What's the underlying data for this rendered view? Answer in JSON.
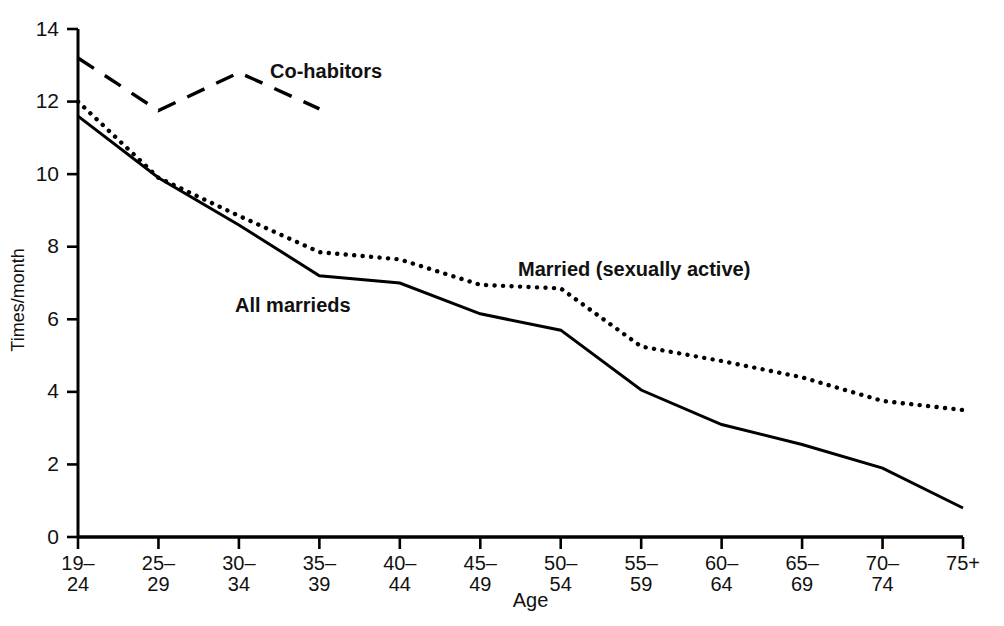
{
  "chart_data": {
    "type": "line",
    "title": "",
    "xlabel": "Age",
    "ylabel": "Times/month",
    "ylim": [
      0,
      14
    ],
    "yticks": [
      0,
      2,
      4,
      6,
      8,
      10,
      12,
      14
    ],
    "ytick_labels": [
      "0",
      "2",
      "4",
      "6",
      "8",
      "10",
      "12",
      "14"
    ],
    "grid": false,
    "legend": "inline-annotations",
    "categories": [
      "19–24",
      "25–29",
      "30–34",
      "35–39",
      "40–44",
      "45–49",
      "50–54",
      "55–59",
      "60–64",
      "65–69",
      "70–74",
      "75+"
    ],
    "xtick_labels_top": [
      "19–",
      "25–",
      "30–",
      "35–",
      "40–",
      "45–",
      "50–",
      "55–",
      "60–",
      "65–",
      "70–",
      "75+"
    ],
    "xtick_labels_bottom": [
      "24",
      "29",
      "34",
      "39",
      "44",
      "49",
      "54",
      "59",
      "64",
      "69",
      "74",
      ""
    ],
    "series": [
      {
        "name": "All marrieds",
        "style": "solid",
        "color": "#000000",
        "values": [
          11.6,
          9.9,
          8.6,
          7.2,
          7.0,
          6.15,
          5.7,
          4.05,
          3.1,
          2.55,
          1.9,
          0.8
        ]
      },
      {
        "name": "Married (sexually active)",
        "style": "dotted",
        "color": "#000000",
        "values": [
          12.0,
          9.9,
          8.85,
          7.85,
          7.65,
          6.95,
          6.85,
          5.25,
          4.85,
          4.4,
          3.75,
          3.5
        ]
      },
      {
        "name": "Co-habitors",
        "style": "dashed",
        "color": "#000000",
        "values": [
          13.2,
          11.75,
          12.8,
          11.8,
          null,
          null,
          null,
          null,
          null,
          null,
          null,
          null
        ]
      }
    ],
    "annotations": [
      {
        "text": "Co-habitors",
        "x_px": 270,
        "y_px": 78,
        "series": "Co-habitors"
      },
      {
        "text": "All marrieds",
        "x_px": 235,
        "y_px": 312,
        "series": "All marrieds"
      },
      {
        "text": "Married (sexually active)",
        "x_px": 518,
        "y_px": 276,
        "series": "Married (sexually active)"
      }
    ]
  },
  "axes": {
    "x_title": "Age",
    "y_title": "Times/month"
  }
}
